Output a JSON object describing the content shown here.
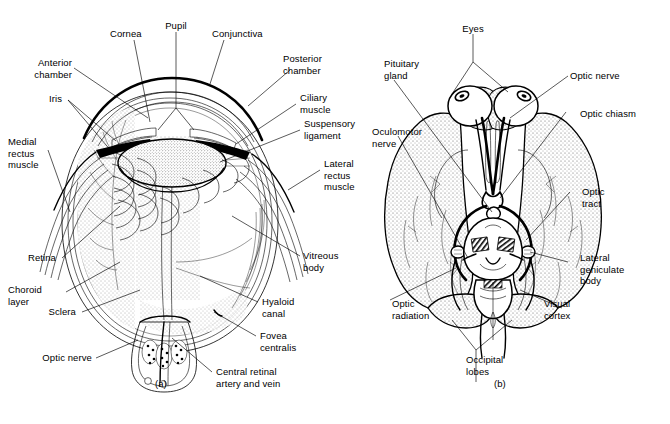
{
  "figure": {
    "background_color": "#ffffff",
    "ink_color": "#000000",
    "panels": [
      {
        "id": "a",
        "caption": "(a)",
        "subject": "sagittal-section-of-human-eye"
      },
      {
        "id": "b",
        "caption": "(b)",
        "subject": "inferior-view-of-brain-visual-pathway"
      }
    ]
  },
  "panel_a": {
    "caption": "(a)",
    "labels": [
      {
        "key": "pupil",
        "text": "Pupil"
      },
      {
        "key": "cornea",
        "text": "Cornea"
      },
      {
        "key": "conjunctiva",
        "text": "Conjunctiva"
      },
      {
        "key": "anterior_chamber",
        "text": "Anterior\nchamber"
      },
      {
        "key": "posterior_chamber",
        "text": "Posterior\nchamber"
      },
      {
        "key": "iris",
        "text": "Iris"
      },
      {
        "key": "ciliary_muscle",
        "text": "Ciliary\nmuscle"
      },
      {
        "key": "medial_rectus_muscle",
        "text": "Medial\nrectus\nmuscle"
      },
      {
        "key": "suspensory_ligament",
        "text": "Suspensory\nligament"
      },
      {
        "key": "lateral_rectus_muscle",
        "text": "Lateral\nrectus\nmuscle"
      },
      {
        "key": "retina",
        "text": "Retina"
      },
      {
        "key": "choroid_layer",
        "text": "Choroid\nlayer"
      },
      {
        "key": "sclera",
        "text": "Sclera"
      },
      {
        "key": "optic_nerve",
        "text": "Optic nerve"
      },
      {
        "key": "vitreous_body",
        "text": "Vitreous\nbody"
      },
      {
        "key": "hyaloid_canal",
        "text": "Hyaloid\ncanal"
      },
      {
        "key": "fovea_centralis",
        "text": "Fovea\ncentralis"
      },
      {
        "key": "central_retinal_artery_and_vein",
        "text": "Central retinal\nartery and vein"
      }
    ]
  },
  "panel_b": {
    "caption": "(b)",
    "labels": [
      {
        "key": "eyes",
        "text": "Eyes"
      },
      {
        "key": "pituitary_gland",
        "text": "Pituitary\ngland"
      },
      {
        "key": "optic_nerve",
        "text": "Optic nerve"
      },
      {
        "key": "optic_chiasm",
        "text": "Optic chiasm"
      },
      {
        "key": "oculomotor_nerve",
        "text": "Oculomotor\nnerve"
      },
      {
        "key": "optic_tract",
        "text": "Optic\ntract"
      },
      {
        "key": "lateral_geniculate_body",
        "text": "Lateral\ngeniculate\nbody"
      },
      {
        "key": "optic_radiation",
        "text": "Optic\nradiation"
      },
      {
        "key": "visual_cortex",
        "text": "Visual\ncortex"
      },
      {
        "key": "occipital_lobes",
        "text": "Occipital\nlobes"
      }
    ]
  }
}
